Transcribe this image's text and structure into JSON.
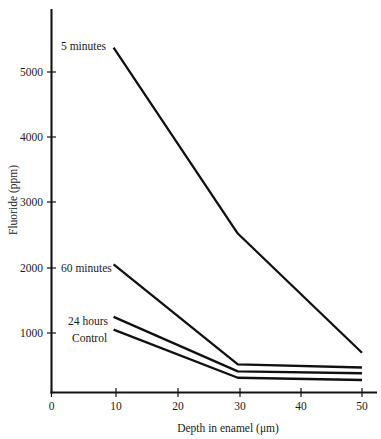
{
  "chart_data": {
    "type": "line",
    "title": "",
    "xlabel": "Depth in enamel (μm)",
    "ylabel": "Fluoride (ppm)",
    "xlim": [
      0,
      52
    ],
    "ylim": [
      0,
      5700
    ],
    "xticks": [
      0,
      10,
      20,
      30,
      40,
      50
    ],
    "xtick_labels": [
      "0",
      "10",
      "20",
      "30",
      "40",
      "50"
    ],
    "yticks": [
      1000,
      2000,
      3000,
      4000,
      5000
    ],
    "ytick_labels": [
      "1000",
      "2000",
      "3000",
      "4000",
      "5000"
    ],
    "grid": false,
    "legend": "inline-labels-left",
    "x": [
      10,
      30,
      50
    ],
    "series": [
      {
        "name": "5 minutes",
        "label": "5 minutes",
        "values": [
          5380,
          2480,
          620
        ],
        "color": "#101010"
      },
      {
        "name": "60 minutes",
        "label": "60 minutes",
        "values": [
          2000,
          440,
          390
        ],
        "color": "#101010"
      },
      {
        "name": "24 hours",
        "label": "24 hours",
        "values": [
          1180,
          330,
          300
        ],
        "color": "#101010"
      },
      {
        "name": "Control",
        "label": "Control",
        "values": [
          980,
          230,
          195
        ],
        "color": "#101010"
      }
    ]
  },
  "axes": {
    "y_title": "Fluoride (ppm)",
    "x_title": "Depth in enamel (μm)",
    "y_labels": {
      "t1000": "1000",
      "t2000": "2000",
      "t3000": "3000",
      "t4000": "4000",
      "t5000": "5000"
    },
    "x_labels": {
      "t0": "0",
      "t10": "10",
      "t20": "20",
      "t30": "30",
      "t40": "40",
      "t50": "50"
    }
  },
  "annotations": {
    "five_minutes": "5 minutes",
    "sixty_minutes": "60 minutes",
    "twentyfour_hours": "24 hours",
    "control": "Control"
  }
}
